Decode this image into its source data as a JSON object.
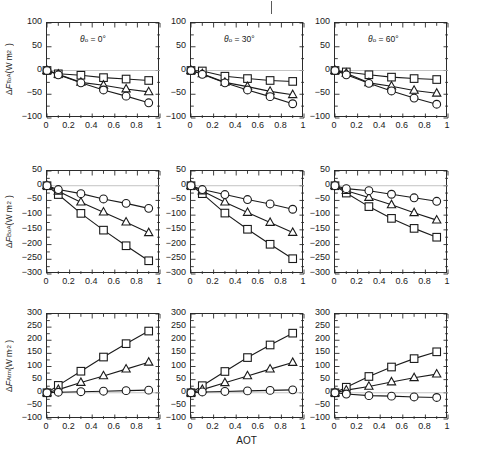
{
  "figure": {
    "xaxis_title": "AOT",
    "x_ticks": [
      "0",
      "0.2",
      "0.4",
      "0.6",
      "0.8",
      "1"
    ],
    "x_tick_values": [
      0,
      0.2,
      0.4,
      0.6,
      0.8,
      1
    ],
    "xlim": [
      0,
      1
    ],
    "rows": [
      {
        "ylabel_parts": {
          "delta": "Δ",
          "F": "F",
          "sub": "ToA",
          "units": "(W m",
          "sup": "−2",
          "close": ")"
        },
        "ylabel_text": "ΔF_ToA (W m−2)",
        "y_ticks": [
          "100",
          "50",
          "0",
          "−50",
          "−100"
        ],
        "y_tick_values": [
          100,
          50,
          0,
          -50,
          -100
        ],
        "ylim": [
          -100,
          100
        ],
        "zeroline": 0
      },
      {
        "ylabel_parts": {
          "delta": "Δ",
          "F": "F",
          "sub": "BoA",
          "units": "(W m",
          "sup": "−2",
          "close": ")"
        },
        "ylabel_text": "ΔF_BoA (W m−2)",
        "y_ticks": [
          "50",
          "0",
          "−50",
          "−100",
          "−150",
          "−200",
          "−250",
          "−300"
        ],
        "y_tick_values": [
          50,
          0,
          -50,
          -100,
          -150,
          -200,
          -250,
          -300
        ],
        "ylim": [
          -300,
          50
        ],
        "zeroline": 0
      },
      {
        "ylabel_parts": {
          "delta": "Δ",
          "F": "F",
          "sub": "Atm",
          "units": "(W m",
          "sup": "−2",
          "close": ")"
        },
        "ylabel_text": "ΔF_Atm (W m−2)",
        "y_ticks": [
          "300",
          "250",
          "200",
          "150",
          "100",
          "50",
          "0",
          "−50",
          "−100"
        ],
        "y_tick_values": [
          300,
          250,
          200,
          150,
          100,
          50,
          0,
          -50,
          -100
        ],
        "ylim": [
          -100,
          300
        ],
        "zeroline": 0
      }
    ],
    "columns": [
      {
        "title_symbol": "θ",
        "title_sub": "o",
        "title_eq": " = 0°",
        "title_text": "θo = 0°"
      },
      {
        "title_symbol": "θ",
        "title_sub": "o",
        "title_eq": " = 30°",
        "title_text": "θo = 30°"
      },
      {
        "title_symbol": "θ",
        "title_sub": "o",
        "title_eq": " = 60°",
        "title_text": "θo = 60°"
      }
    ]
  },
  "chart_data": [
    {
      "type": "line",
      "title": "θo = 0°",
      "panel": "row1-col1",
      "xlabel": "AOT",
      "ylabel": "ΔF_ToA (W m−2)",
      "xlim": [
        0,
        1
      ],
      "ylim": [
        -100,
        100
      ],
      "grid": false,
      "legend": "none",
      "x": [
        0,
        0.1,
        0.3,
        0.5,
        0.7,
        0.9
      ],
      "series": [
        {
          "name": "square",
          "marker": "square",
          "values": [
            0,
            -7,
            -10,
            -15,
            -18,
            -21
          ]
        },
        {
          "name": "triangle",
          "marker": "triangle",
          "values": [
            0,
            -8,
            -25,
            -31,
            -39,
            -45
          ]
        },
        {
          "name": "circle",
          "marker": "circle",
          "values": [
            0,
            -9,
            -26,
            -41,
            -54,
            -68
          ]
        }
      ]
    },
    {
      "type": "line",
      "title": "θo = 30°",
      "panel": "row1-col2",
      "xlabel": "AOT",
      "ylabel": "ΔF_ToA (W m−2)",
      "xlim": [
        0,
        1
      ],
      "ylim": [
        -100,
        100
      ],
      "grid": false,
      "legend": "none",
      "x": [
        0,
        0.1,
        0.3,
        0.5,
        0.7,
        0.9
      ],
      "series": [
        {
          "name": "square",
          "marker": "square",
          "values": [
            0,
            -1,
            -12,
            -17,
            -21,
            -23
          ]
        },
        {
          "name": "triangle",
          "marker": "triangle",
          "values": [
            0,
            -7,
            -25,
            -34,
            -44,
            -51
          ]
        },
        {
          "name": "circle",
          "marker": "circle",
          "values": [
            0,
            -8,
            -26,
            -41,
            -55,
            -70
          ]
        }
      ]
    },
    {
      "type": "line",
      "title": "θo = 60°",
      "panel": "row1-col3",
      "xlabel": "AOT",
      "ylabel": "ΔF_ToA (W m−2)",
      "xlim": [
        0,
        1
      ],
      "ylim": [
        -100,
        100
      ],
      "grid": false,
      "legend": "none",
      "x": [
        0,
        0.1,
        0.3,
        0.5,
        0.7,
        0.9
      ],
      "series": [
        {
          "name": "square",
          "marker": "square",
          "values": [
            0,
            -3,
            -9,
            -14,
            -17,
            -19
          ]
        },
        {
          "name": "triangle",
          "marker": "triangle",
          "values": [
            0,
            -6,
            -26,
            -33,
            -42,
            -48
          ]
        },
        {
          "name": "circle",
          "marker": "circle",
          "values": [
            0,
            -9,
            -27,
            -43,
            -58,
            -71
          ]
        }
      ]
    },
    {
      "type": "line",
      "title": "θo = 0°",
      "panel": "row2-col1",
      "xlabel": "AOT",
      "ylabel": "ΔF_BoA (W m−2)",
      "xlim": [
        0,
        1
      ],
      "ylim": [
        -300,
        50
      ],
      "grid": false,
      "legend": "none",
      "x": [
        0,
        0.1,
        0.3,
        0.5,
        0.7,
        0.9
      ],
      "series": [
        {
          "name": "square",
          "marker": "square",
          "values": [
            0,
            -30,
            -94,
            -151,
            -204,
            -255
          ]
        },
        {
          "name": "triangle",
          "marker": "triangle",
          "values": [
            0,
            -19,
            -56,
            -90,
            -124,
            -160
          ]
        },
        {
          "name": "circle",
          "marker": "circle",
          "values": [
            0,
            -13,
            -27,
            -45,
            -60,
            -77
          ]
        }
      ]
    },
    {
      "type": "line",
      "title": "θo = 30°",
      "panel": "row2-col2",
      "xlabel": "AOT",
      "ylabel": "ΔF_BoA (W m−2)",
      "xlim": [
        0,
        1
      ],
      "ylim": [
        -300,
        50
      ],
      "grid": false,
      "legend": "none",
      "x": [
        0,
        0.1,
        0.3,
        0.5,
        0.7,
        0.9
      ],
      "series": [
        {
          "name": "square",
          "marker": "square",
          "values": [
            0,
            -27,
            -93,
            -148,
            -199,
            -248
          ]
        },
        {
          "name": "triangle",
          "marker": "triangle",
          "values": [
            0,
            -18,
            -56,
            -91,
            -125,
            -159
          ]
        },
        {
          "name": "circle",
          "marker": "circle",
          "values": [
            0,
            -13,
            -30,
            -47,
            -62,
            -80
          ]
        }
      ]
    },
    {
      "type": "line",
      "title": "θo = 60°",
      "panel": "row2-col3",
      "xlabel": "AOT",
      "ylabel": "ΔF_BoA (W m−2)",
      "xlim": [
        0,
        1
      ],
      "ylim": [
        -300,
        50
      ],
      "grid": false,
      "legend": "none",
      "x": [
        0,
        0.1,
        0.3,
        0.5,
        0.7,
        0.9
      ],
      "series": [
        {
          "name": "square",
          "marker": "square",
          "values": [
            0,
            -25,
            -71,
            -111,
            -145,
            -175
          ]
        },
        {
          "name": "triangle",
          "marker": "triangle",
          "values": [
            0,
            -17,
            -40,
            -65,
            -92,
            -117
          ]
        },
        {
          "name": "circle",
          "marker": "circle",
          "values": [
            0,
            -10,
            -17,
            -29,
            -41,
            -53
          ]
        }
      ]
    },
    {
      "type": "line",
      "title": "θo = 0°",
      "panel": "row3-col1",
      "xlabel": "AOT",
      "ylabel": "ΔF_Atm (W m−2)",
      "xlim": [
        0,
        1
      ],
      "ylim": [
        -100,
        300
      ],
      "grid": false,
      "legend": "none",
      "x": [
        0,
        0.1,
        0.3,
        0.5,
        0.7,
        0.9
      ],
      "series": [
        {
          "name": "square",
          "marker": "square",
          "values": [
            0,
            28,
            82,
            136,
            187,
            235
          ]
        },
        {
          "name": "triangle",
          "marker": "triangle",
          "values": [
            0,
            12,
            39,
            64,
            90,
            116
          ]
        },
        {
          "name": "circle",
          "marker": "circle",
          "values": [
            0,
            2,
            4,
            6,
            8,
            10
          ]
        }
      ]
    },
    {
      "type": "line",
      "title": "θo = 30°",
      "panel": "row3-col2",
      "xlabel": "AOT",
      "ylabel": "ΔF_Atm (W m−2)",
      "xlim": [
        0,
        1
      ],
      "ylim": [
        -100,
        300
      ],
      "grid": false,
      "legend": "none",
      "x": [
        0,
        0.1,
        0.3,
        0.5,
        0.7,
        0.9
      ],
      "series": [
        {
          "name": "square",
          "marker": "square",
          "values": [
            0,
            27,
            81,
            134,
            182,
            227
          ]
        },
        {
          "name": "triangle",
          "marker": "triangle",
          "values": [
            0,
            12,
            38,
            64,
            90,
            115
          ]
        },
        {
          "name": "circle",
          "marker": "circle",
          "values": [
            0,
            3,
            5,
            7,
            9,
            11
          ]
        }
      ]
    },
    {
      "type": "line",
      "title": "θo = 60°",
      "panel": "row3-col3",
      "xlabel": "AOT",
      "ylabel": "ΔF_Atm (W m−2)",
      "xlim": [
        0,
        1
      ],
      "ylim": [
        -100,
        300
      ],
      "grid": false,
      "legend": "none",
      "x": [
        0,
        0.1,
        0.3,
        0.5,
        0.7,
        0.9
      ],
      "series": [
        {
          "name": "square",
          "marker": "square",
          "values": [
            0,
            21,
            62,
            98,
            130,
            156
          ]
        },
        {
          "name": "triangle",
          "marker": "triangle",
          "values": [
            0,
            10,
            24,
            41,
            57,
            71
          ]
        },
        {
          "name": "circle",
          "marker": "circle",
          "values": [
            0,
            -5,
            -11,
            -13,
            -16,
            -18
          ]
        }
      ]
    }
  ]
}
